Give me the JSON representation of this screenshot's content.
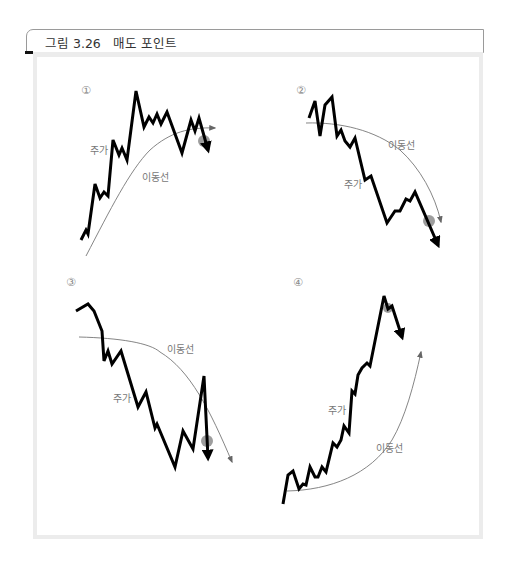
{
  "figure": {
    "title": "그림 3.26   매도 포인트"
  },
  "panels": [
    {
      "number": "①",
      "price_label": "주가",
      "ma_label": "이동선",
      "description": "주가가 이동평균선 위에서 상승 후 하락하여 이동평균선을 하향 돌파 — 매도 포인트"
    },
    {
      "number": "②",
      "price_label": "주가",
      "ma_label": "이동선",
      "description": "하락하는 이동평균선 아래에서 주가가 반등 후 이동평균선에 닿고 다시 하락 — 매도 포인트"
    },
    {
      "number": "③",
      "price_label": "주가",
      "ma_label": "이동선",
      "description": "하락하는 이동평균선을 주가가 일시적으로 상향 돌파 후 다시 하락 — 매도 포인트"
    },
    {
      "number": "④",
      "price_label": "주가",
      "ma_label": "이동선",
      "description": "주가가 상승하는 이동평균선에서 크게 이탈하여 급등한 후 하락 — 매도 포인트"
    }
  ],
  "colors": {
    "price_line": "#000000",
    "ma_line": "#777777",
    "sell_point": "#8c8c8c",
    "frame_border": "#ececec",
    "title_border": "#9a9a9a"
  }
}
